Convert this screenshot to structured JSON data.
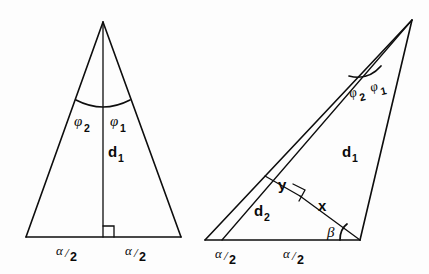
{
  "figure": {
    "background_color": "#fdfdfd",
    "ink_color": "#0d0d0d"
  },
  "left_diagram": {
    "name": "isosceles-triangle",
    "labels": {
      "phi2": "φ",
      "phi2_sub": "2",
      "phi1": "φ",
      "phi1_sub": "1",
      "d1": "d",
      "d1_sub": "1",
      "alpha_left": "α",
      "alpha_left_denom": "2",
      "alpha_right": "α",
      "alpha_right_denom": "2",
      "slash": "/"
    },
    "geometry": {
      "apex": [
        103,
        22
      ],
      "base_left": [
        26,
        237
      ],
      "base_right": [
        181,
        237
      ],
      "foot": [
        103,
        237
      ],
      "arc_left_end": [
        78,
        104
      ],
      "arc_right_end": [
        128,
        104
      ]
    }
  },
  "right_diagram": {
    "name": "oblique-triangle",
    "labels": {
      "phi2": "φ",
      "phi2_sub": "2",
      "phi1": "φ",
      "phi1_sub": "1",
      "d1": "d",
      "d1_sub": "1",
      "d2": "d",
      "d2_sub": "2",
      "y": "y",
      "x": "x",
      "beta": "β",
      "alpha_left": "α",
      "alpha_left_denom": "2",
      "alpha_right": "α",
      "alpha_right_denom": "2",
      "slash": "/"
    },
    "geometry": {
      "apex": [
        412,
        20
      ],
      "base_left": [
        205,
        240
      ],
      "base_right": [
        360,
        240
      ],
      "mid_base": [
        222,
        240
      ],
      "y_start": [
        265,
        176
      ],
      "perp_foot": [
        300,
        196
      ]
    }
  }
}
